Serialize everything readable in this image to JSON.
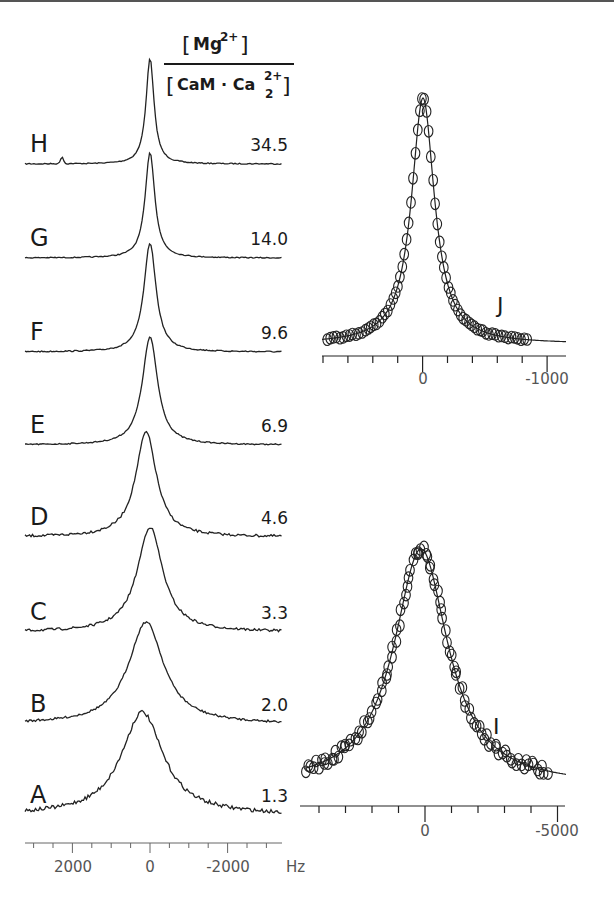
{
  "figure": {
    "header": {
      "numerator": "[Mg2+]",
      "numerator_base": "Mg",
      "numerator_sup": "2+",
      "denominator": "[CaM · Ca2 2+]",
      "denominator_base": "CaM · Ca",
      "denominator_sub": "2",
      "denominator_sup": "2+"
    },
    "x_unit": "Hz",
    "left_axis_ticks": [
      "2000",
      "0",
      "-2000"
    ],
    "panel_j": {
      "label": "J",
      "ticks": [
        "0",
        "-1000"
      ]
    },
    "panel_i": {
      "label": "I",
      "ticks": [
        "0",
        "-5000"
      ]
    }
  },
  "chart_data": [
    {
      "type": "line",
      "title": "Stacked NMR spectra vs [Mg2+]/[CaM·Ca2 2+] ratio",
      "xlabel": "Hz",
      "ylabel": "",
      "xlim": [
        3200,
        -3400
      ],
      "x_ticks": [
        2000,
        0,
        -2000
      ],
      "grid": false,
      "series": [
        {
          "name": "H",
          "ratio": "34.5",
          "peak_hz": 0,
          "approx_fwhm_hz": 250,
          "note": "small side peak near +2250 Hz"
        },
        {
          "name": "G",
          "ratio": "14.0",
          "peak_hz": 0,
          "approx_fwhm_hz": 300
        },
        {
          "name": "F",
          "ratio": "9.6",
          "peak_hz": 0,
          "approx_fwhm_hz": 380
        },
        {
          "name": "E",
          "ratio": "6.9",
          "peak_hz": 0,
          "approx_fwhm_hz": 480
        },
        {
          "name": "D",
          "ratio": "4.6",
          "peak_hz": 100,
          "approx_fwhm_hz": 650
        },
        {
          "name": "C",
          "ratio": "3.3",
          "peak_hz": 0,
          "approx_fwhm_hz": 800
        },
        {
          "name": "B",
          "ratio": "2.0",
          "peak_hz": 100,
          "approx_fwhm_hz": 1100
        },
        {
          "name": "A",
          "ratio": "1.3",
          "peak_hz": 200,
          "approx_fwhm_hz": 1300
        }
      ],
      "legend": "ratio labels at right of each trace"
    },
    {
      "type": "scatter",
      "title": "J",
      "xlabel": "Hz",
      "xlim": [
        1000,
        -1200
      ],
      "x_ticks": [
        0,
        -1000
      ],
      "description": "Circles (data) with solid line fit; narrow Lorentzian centered at 0 Hz",
      "peak_x": 0,
      "approx_fwhm_hz": 160
    },
    {
      "type": "scatter",
      "title": "I",
      "xlabel": "Hz",
      "xlim": [
        4600,
        -5500
      ],
      "x_ticks": [
        0,
        -5000
      ],
      "description": "Circles (data) with solid line fit; broader Lorentzian centered near 0 Hz, noisy baseline",
      "peak_x": 100,
      "approx_fwhm_hz": 1300
    }
  ],
  "traces": {
    "labels": [
      "H",
      "G",
      "F",
      "E",
      "D",
      "C",
      "B",
      "A"
    ],
    "ratios": [
      "34.5",
      "14.0",
      "9.6",
      "6.9",
      "4.6",
      "3.3",
      "2.0",
      "1.3"
    ]
  }
}
